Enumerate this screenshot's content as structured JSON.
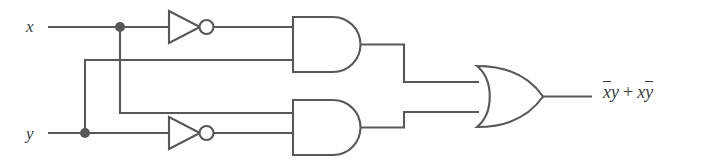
{
  "figure": {
    "background_color": "#ffffff",
    "line_color": "#58585a",
    "text_color": "#3b3b3d"
  },
  "inputs": [
    {
      "id": "x",
      "label": "x",
      "y": 27
    },
    {
      "id": "y",
      "label": "y",
      "y": 133
    }
  ],
  "output": {
    "expression_parts": {
      "not_x": "x",
      "y": "y",
      "plus": "+",
      "x": "x",
      "not_y": "y"
    },
    "expression_plain": "x̄y + xȳ"
  },
  "gates": [
    {
      "id": "inverter-x",
      "type": "NOT",
      "label": "NOT",
      "input": "x",
      "output": "x-bar"
    },
    {
      "id": "inverter-y",
      "type": "NOT",
      "label": "NOT",
      "input": "y",
      "output": "y-bar"
    },
    {
      "id": "and-top",
      "type": "AND",
      "label": "AND",
      "inputs": [
        "x-bar",
        "y"
      ],
      "output": "x-bar-y"
    },
    {
      "id": "and-bottom",
      "type": "AND",
      "label": "AND",
      "inputs": [
        "x",
        "y-bar"
      ],
      "output": "x-y-bar"
    },
    {
      "id": "or-out",
      "type": "OR",
      "label": "OR",
      "inputs": [
        "x-bar-y",
        "x-y-bar"
      ],
      "output": "x-bar-y + x-y-bar"
    }
  ],
  "junctions": [
    {
      "id": "junction-x",
      "cx": 120,
      "cy": 27
    },
    {
      "id": "junction-y",
      "cx": 85,
      "cy": 133
    }
  ]
}
